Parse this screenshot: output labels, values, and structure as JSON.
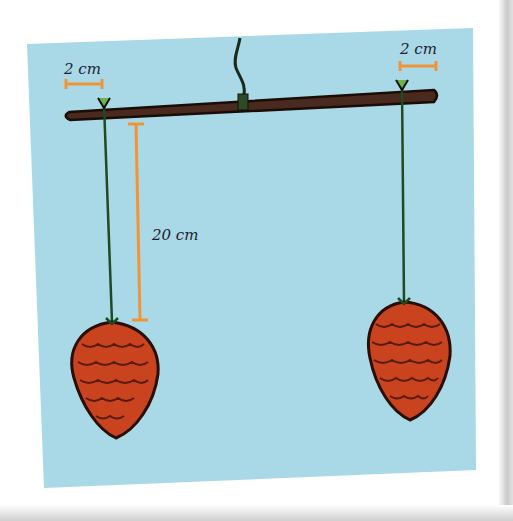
{
  "diagram": {
    "title": "",
    "labels": {
      "left_offset": "2 cm",
      "right_offset": "2 cm",
      "string_length": "20 cm"
    },
    "colors": {
      "background_panel": "#a9d8e6",
      "stick": "#4a2a1e",
      "string": "#1f4a22",
      "measure": "#f0943a",
      "pine_cone": "#c9431e",
      "pine_cone_outline": "#3a1208"
    },
    "elements": [
      "hanging-string",
      "stick",
      "left-string",
      "right-string",
      "left-pine-cone",
      "right-pine-cone"
    ]
  }
}
